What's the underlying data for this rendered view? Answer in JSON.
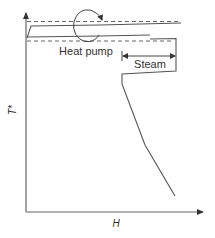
{
  "diagram": {
    "type": "grand-composite-curve",
    "axes": {
      "y_label": "T*",
      "x_label": "H"
    },
    "annotations": {
      "heat_pump": "Heat pump",
      "steam": "Steam"
    },
    "colors": {
      "line": "#555555",
      "text": "#333333",
      "background": "#ffffff"
    }
  }
}
